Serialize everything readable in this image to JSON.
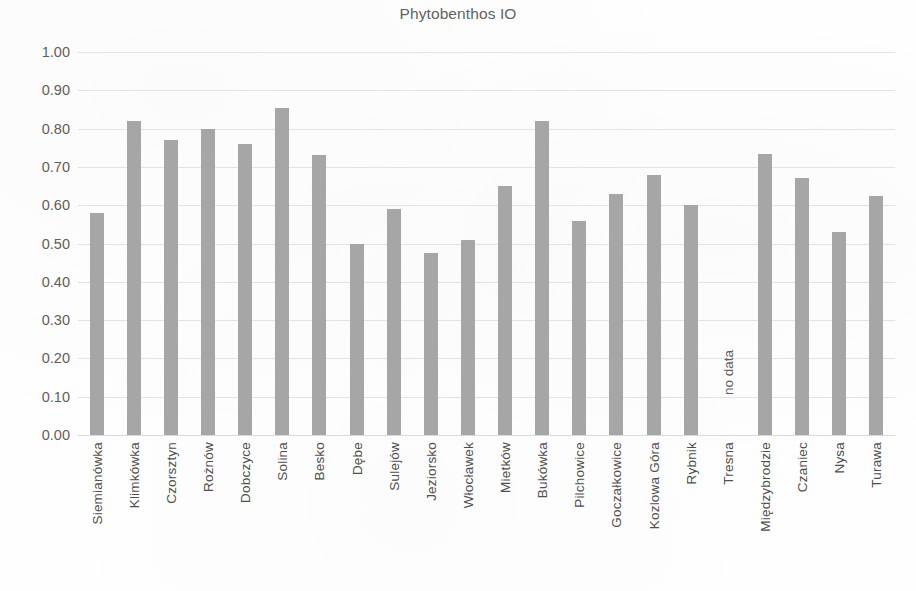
{
  "chart_data": {
    "type": "bar",
    "title": "Phytobenthos IO",
    "xlabel": "",
    "ylabel": "",
    "ylim": [
      0.0,
      1.0
    ],
    "grid": true,
    "legend": null,
    "bar_color": "#a6a6a6",
    "gridline_color": "#e3e3e3",
    "y_ticks": [
      "0.00",
      "0.10",
      "0.20",
      "0.30",
      "0.40",
      "0.50",
      "0.60",
      "0.70",
      "0.80",
      "0.90",
      "1.00"
    ],
    "y_tick_values": [
      0.0,
      0.1,
      0.2,
      0.3,
      0.4,
      0.5,
      0.6,
      0.7,
      0.8,
      0.9,
      1.0
    ],
    "categories": [
      "Siemianówka",
      "Klimkówka",
      "Czorsztyn",
      "Rożnów",
      "Dobczyce",
      "Solina",
      "Besko",
      "Dębe",
      "Sulejów",
      "Jeziorsko",
      "Włocławek",
      "Mietków",
      "Bukówka",
      "Pilchowice",
      "Goczałkowice",
      "Kozlowa Góra",
      "Rybnik",
      "Tresna",
      "Międzybrodzie",
      "Czaniec",
      "Nysa",
      "Turawa"
    ],
    "values": [
      0.58,
      0.82,
      0.77,
      0.8,
      0.76,
      0.855,
      0.73,
      0.5,
      0.59,
      0.475,
      0.51,
      0.65,
      0.82,
      0.56,
      0.63,
      0.68,
      0.6,
      null,
      0.735,
      0.67,
      0.53,
      0.625
    ],
    "annotations": [
      {
        "category": "Tresna",
        "text": "no data",
        "orientation": "vertical"
      }
    ]
  }
}
